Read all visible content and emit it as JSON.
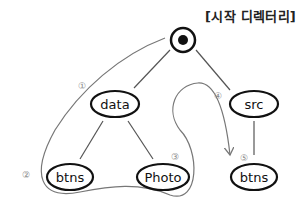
{
  "title": "[시작 디렉터리]",
  "nodes": {
    "root": {
      "label": ""
    },
    "data": {
      "label": "data"
    },
    "src": {
      "label": "src"
    },
    "btns_left": {
      "label": "btns"
    },
    "photo": {
      "label": "Photo"
    },
    "btns_right": {
      "label": "btns"
    }
  },
  "steps": [
    "①",
    "②",
    "③",
    "④",
    "⑤"
  ],
  "colors": {
    "node_stroke": "#111111",
    "edge": "#555555",
    "path": "#777777",
    "step": "#888888"
  }
}
